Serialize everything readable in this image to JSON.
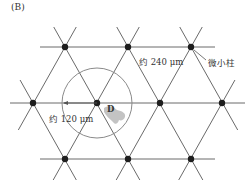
{
  "figure": {
    "panel_label": "(B)",
    "labels": {
      "spacing_large": "约 240 μm",
      "spacing_small": "约 120 μm",
      "pillar": "微小柱",
      "droplet": "D"
    },
    "colors": {
      "line": "#6a6a6a",
      "node": "#1e1e1e",
      "circle": "#8a8a8a",
      "droplet": "#b8b8b8",
      "text": "#333333"
    },
    "lattice": {
      "rows": [
        {
          "y": 47,
          "x": [
            65,
            128,
            191
          ]
        },
        {
          "y": 103,
          "x": [
            33,
            97,
            160,
            222
          ]
        },
        {
          "y": 159,
          "x": [
            65,
            128,
            191
          ]
        }
      ],
      "pitch_px": 63
    },
    "circle": {
      "cx": 97,
      "cy": 103,
      "r": 35
    }
  }
}
